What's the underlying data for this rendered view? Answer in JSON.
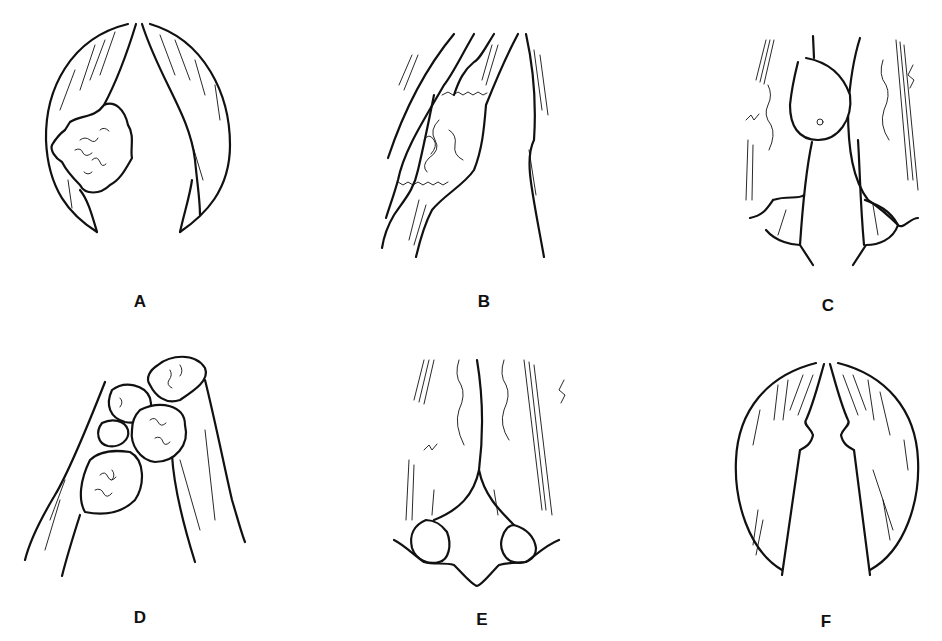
{
  "figure": {
    "panels": [
      {
        "id": "A",
        "label": "A",
        "description": "Vocal folds with irregular lesion on left fold"
      },
      {
        "id": "B",
        "label": "B",
        "description": "Oblique view of fold with excised lesion region"
      },
      {
        "id": "C",
        "label": "C",
        "description": "Folds with rounded polypoid mass"
      },
      {
        "id": "D",
        "label": "D",
        "description": "Fold with multiple clustered papillomatous lesions"
      },
      {
        "id": "E",
        "label": "E",
        "description": "Posterior view with arytenoid bulges"
      },
      {
        "id": "F",
        "label": "F",
        "description": "Vocal folds with bilateral nodules"
      }
    ]
  }
}
